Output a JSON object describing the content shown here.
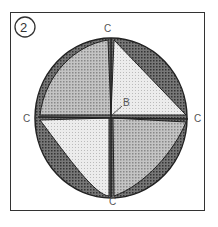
{
  "figure": {
    "number": "2",
    "labels": {
      "top": "C",
      "left": "C",
      "right": "C",
      "bottom": "C",
      "center": "B"
    }
  },
  "colors": {
    "dark": "#555555",
    "medium": "#a8a8a8",
    "light": "#dcdcdc",
    "stroke": "#222222"
  }
}
